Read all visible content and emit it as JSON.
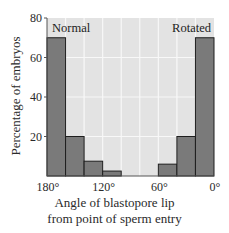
{
  "chart_data": {
    "type": "bar",
    "title": "",
    "xlabel": "Angle of blastopore lip from point of sperm entry",
    "xlabel_lines": [
      "Angle of blastopore lip",
      "from point of sperm entry"
    ],
    "ylabel": "Percentage of embryos",
    "ylim": [
      0,
      80
    ],
    "yticks": [
      20,
      40,
      60,
      80
    ],
    "xlim": [
      180,
      0
    ],
    "xticks": [
      {
        "value": 180,
        "label": "180°"
      },
      {
        "value": 120,
        "label": "120°"
      },
      {
        "value": 60,
        "label": "60°"
      },
      {
        "value": 0,
        "label": "0°"
      }
    ],
    "bin_width_deg": 20,
    "categories": [
      "180–160°",
      "160–140°",
      "140–120°",
      "120–100°",
      "100–80°",
      "80–60°",
      "60–40°",
      "40–20°",
      "20–0°"
    ],
    "values": [
      70,
      20,
      7.5,
      2.5,
      0,
      0,
      6,
      20,
      70
    ],
    "annotations": [
      {
        "text": "Normal",
        "position": "top-left"
      },
      {
        "text": "Rotated",
        "position": "top-right"
      }
    ],
    "grid": true,
    "colors": {
      "bar": "#7a7a7a",
      "bar_edge": "#1e1e1e",
      "plot_bg": "#e3e3e3",
      "grid": "#f8f8f8"
    }
  }
}
